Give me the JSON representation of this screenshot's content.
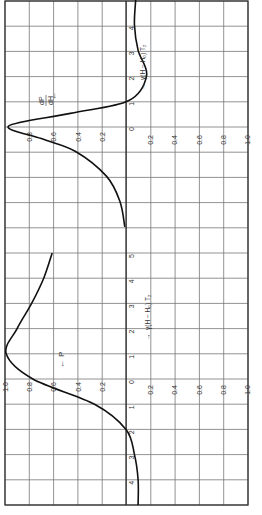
{
  "chart_data": [
    {
      "type": "line",
      "title": "",
      "orientation": "rotated 90 degrees (value axis horizontal, field axis vertical)",
      "series": [
        {
          "name": "dP/dH",
          "x": [
            -4,
            -3,
            -2,
            -1,
            -0.5,
            0,
            0.5,
            1,
            2,
            3,
            4,
            5
          ],
          "values": [
            0.01,
            0.05,
            0.16,
            0.42,
            0.7,
            0.97,
            0.46,
            -0.02,
            -0.17,
            -0.1,
            -0.07,
            -0.08
          ]
        }
      ],
      "xlabel": "γ(H − H₀) T₂",
      "ylabel": "dP/dH",
      "x_ticks": [
        "0",
        "1",
        "2",
        "3",
        "4"
      ],
      "value_ticks_positive": [
        "0.2",
        "0.4",
        "0.6",
        "0.8"
      ],
      "value_ticks_negative": [
        "0.2",
        "0.4",
        "0.6",
        "0.8",
        "1.0"
      ],
      "ylim": [
        -1.0,
        1.0
      ],
      "grid": true
    },
    {
      "type": "line",
      "title": "",
      "orientation": "rotated 90 degrees (value axis horizontal, field axis vertical)",
      "series": [
        {
          "name": "P",
          "x": [
            -5,
            -4,
            -3,
            -2,
            -1,
            0,
            1,
            2,
            3,
            4,
            5
          ],
          "values": [
            -0.1,
            -0.1,
            -0.07,
            0.0,
            0.26,
            0.77,
            0.99,
            0.9,
            0.78,
            0.68,
            0.61
          ]
        }
      ],
      "xlabel": "γ(H − H₀) T₂",
      "ylabel": "P",
      "x_ticks": [
        "1",
        "2",
        "3",
        "4",
        "5",
        "0",
        "1",
        "2",
        "3",
        "4"
      ],
      "value_ticks_positive": [
        "1.0",
        "0.8",
        "0.6",
        "0.4",
        "0.2"
      ],
      "value_ticks_negative": [
        "0.2",
        "0.4",
        "0.6",
        "0.8",
        "1.0"
      ],
      "ylim": [
        -1.0,
        1.0
      ],
      "grid": true
    }
  ],
  "labels": {
    "top_panel_ylabel": "dP/dH",
    "top_panel_xlabel": "γ(H − H₀) T₂",
    "bottom_panel_ylabel": "P",
    "bottom_panel_xlabel": "γ(H − H₀) T₂"
  }
}
